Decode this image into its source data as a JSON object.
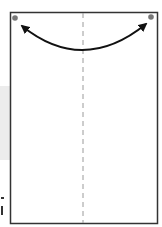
{
  "diagram": {
    "type": "origami-fold-step",
    "paper": {
      "x": 10,
      "y": 12,
      "width": 147,
      "height": 212,
      "stroke": "#333333",
      "fill": "#ffffff"
    },
    "fold_line": {
      "style": "dashed",
      "orientation": "vertical",
      "x": 83,
      "color": "#9a9a9a"
    },
    "corner_dots": [
      {
        "name": "top-left-corner-dot",
        "cx": 15,
        "cy": 18,
        "color": "#777777"
      },
      {
        "name": "top-right-corner-dot",
        "cx": 151,
        "cy": 17,
        "color": "#777777"
      }
    ],
    "arrow": {
      "type": "double-headed-curved",
      "from": "top-left-corner",
      "to": "top-right-corner",
      "color": "#111111"
    },
    "colors": {
      "outline": "#333333",
      "fold": "#9a9a9a",
      "dot": "#777777",
      "arrow": "#111111",
      "side_band": "#ececec"
    }
  }
}
